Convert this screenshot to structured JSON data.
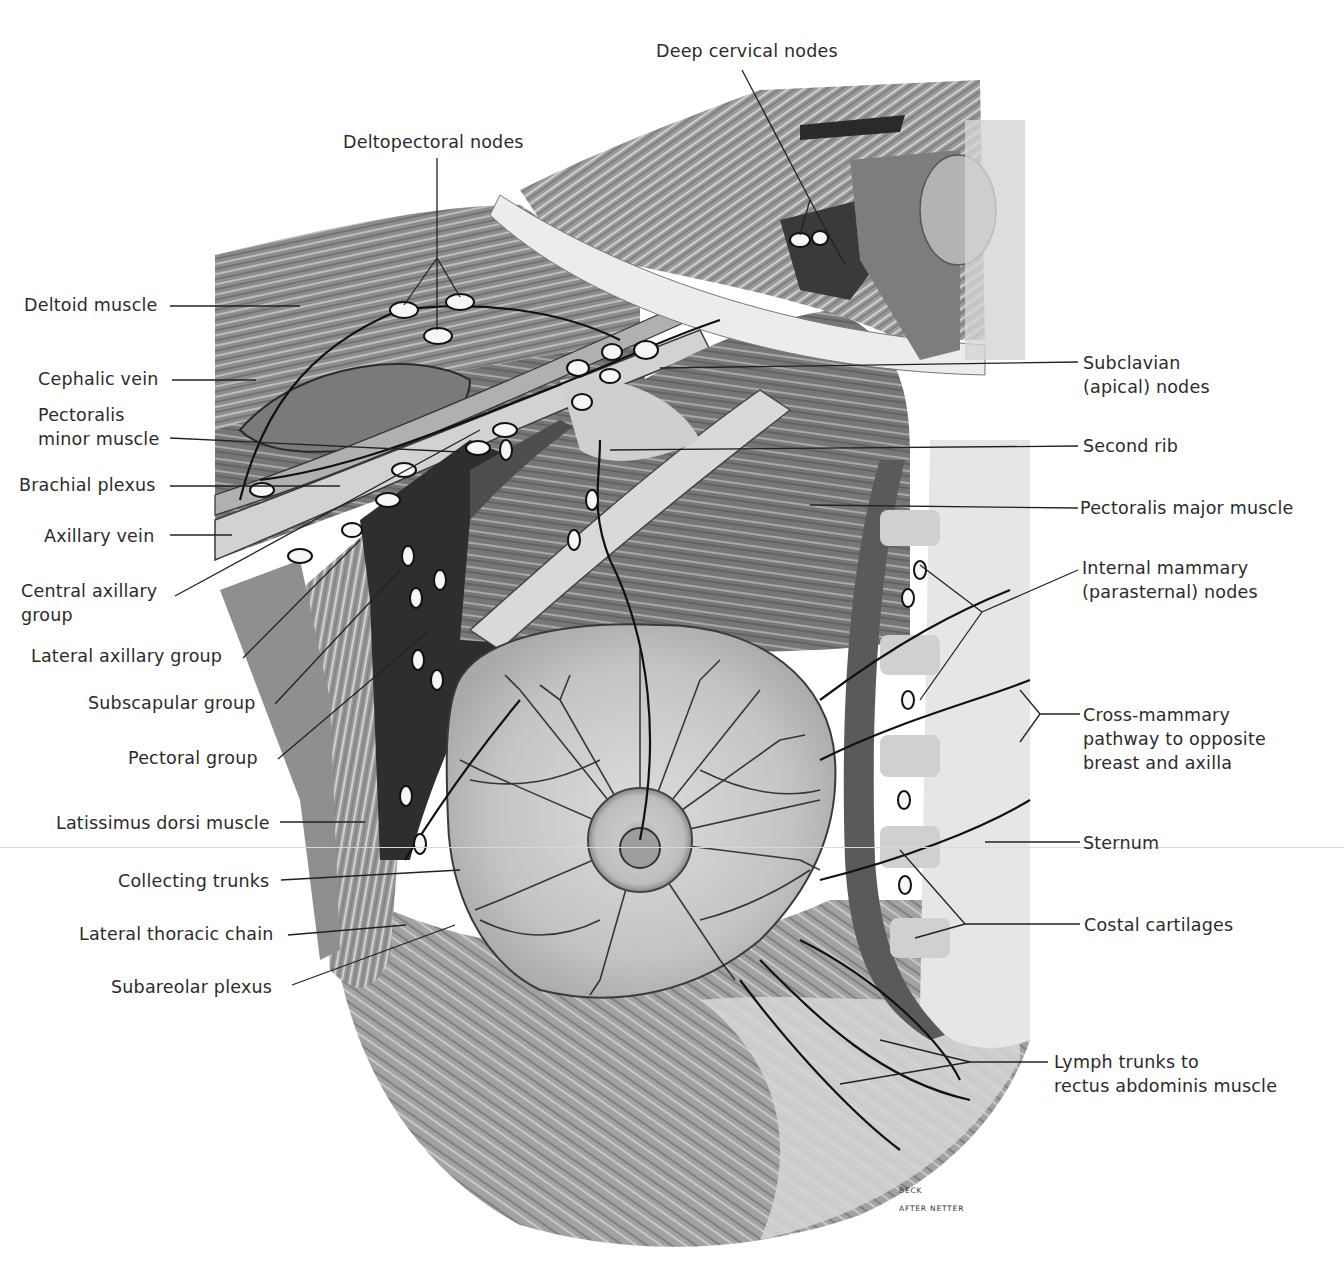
{
  "figure": {
    "credit_line1": "BECK",
    "credit_line2": "AFTER NETTER"
  },
  "labels": {
    "deep_cervical_nodes": "Deep cervical nodes",
    "deltopectoral_nodes": "Deltopectoral nodes",
    "deltoid_muscle": "Deltoid muscle",
    "cephalic_vein": "Cephalic vein",
    "pectoralis_minor_1": "Pectoralis",
    "pectoralis_minor_2": "minor muscle",
    "brachial_plexus": "Brachial plexus",
    "axillary_vein": "Axillary vein",
    "central_axillary_1": "Central axillary",
    "central_axillary_2": "group",
    "lateral_axillary_group": "Lateral axillary group",
    "subscapular_group": "Subscapular group",
    "pectoral_group": "Pectoral group",
    "latissimus_dorsi": "Latissimus dorsi muscle",
    "collecting_trunks": "Collecting trunks",
    "lateral_thoracic_chain": "Lateral thoracic chain",
    "subareolar_plexus": "Subareolar plexus",
    "subclavian_1": "Subclavian",
    "subclavian_2": "(apical) nodes",
    "second_rib": "Second rib",
    "pectoralis_major": "Pectoralis major muscle",
    "internal_mammary_1": "Internal mammary",
    "internal_mammary_2": "(parasternal) nodes",
    "cross_mammary_1": "Cross-mammary",
    "cross_mammary_2": "pathway to opposite",
    "cross_mammary_3": "breast and axilla",
    "sternum": "Sternum",
    "costal_cartilages": "Costal cartilages",
    "lymph_trunks_1": "Lymph trunks to",
    "lymph_trunks_2": "rectus abdominis muscle"
  },
  "colors": {
    "ink": "#1a1a1a",
    "muscle_dark": "#5c5c5c",
    "muscle_mid": "#8a8a8a",
    "muscle_light": "#b5b5b5",
    "breast": "#c9c9c9",
    "node": "#f4f4f4",
    "bone": "#d6d6d6",
    "background": "#ffffff"
  }
}
